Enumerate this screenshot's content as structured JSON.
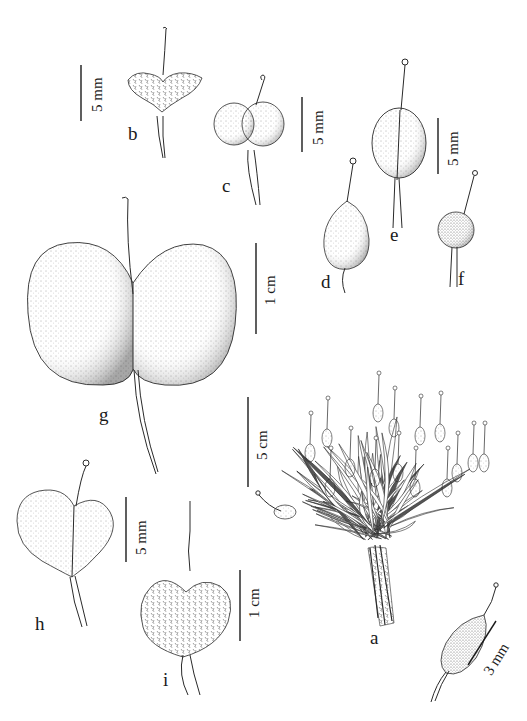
{
  "figure": {
    "type": "botanical illustration plate",
    "panels": [
      {
        "id": "a",
        "label": "a",
        "description": "whole plant, tufted cushion with leaves and fruits",
        "scale": "5 cm"
      },
      {
        "id": "a-detail",
        "label": "",
        "description": "single fruit detail (lower right)",
        "scale": "3 mm"
      },
      {
        "id": "b",
        "label": "b",
        "description": "heart-shaped hairy fruit with style",
        "scale": "5 mm"
      },
      {
        "id": "c",
        "label": "c",
        "description": "didymous (two-lobed) papillose fruit",
        "scale": "5 mm"
      },
      {
        "id": "d",
        "label": "d",
        "description": "ovoid dotted fruit with long style",
        "scale": "5 mm"
      },
      {
        "id": "e",
        "label": "e",
        "description": "ellipsoid fruit with septum line",
        "scale": "5 mm"
      },
      {
        "id": "f",
        "label": "f",
        "description": "small globose fruit",
        "scale": "5 mm"
      },
      {
        "id": "g",
        "label": "g",
        "description": "large didymous hairy fruit",
        "scale": "1 cm"
      },
      {
        "id": "h",
        "label": "h",
        "description": "obcordate dotted fruit",
        "scale": "5 mm"
      },
      {
        "id": "i",
        "label": "i",
        "description": "bilobed hairy fruit",
        "scale": "1 cm"
      }
    ]
  },
  "labels": {
    "a": "a",
    "b": "b",
    "c": "c",
    "d": "d",
    "e": "e",
    "f": "f",
    "g": "g",
    "h": "h",
    "i": "i"
  },
  "scales": {
    "b": "5 mm",
    "c": "5 mm",
    "ef": "5 mm",
    "g": "1 cm",
    "a": "5 cm",
    "h": "5 mm",
    "i": "1 cm",
    "detail": "3 mm"
  },
  "colors": {
    "ink": "#2a2a2a",
    "background": "#ffffff"
  }
}
